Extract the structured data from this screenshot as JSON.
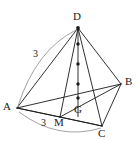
{
  "figure": {
    "background_color": "#ffffff",
    "edge_color": "#1a1a1a",
    "arc_color": "#8a8a8a",
    "point_color": "#1a1a1a",
    "width": 140,
    "height": 142,
    "vertices": [
      {
        "name": "D",
        "label": "D",
        "x": 78,
        "y": 28,
        "label_x": 73,
        "label_y": 13
      },
      {
        "name": "A",
        "label": "A",
        "x": 17,
        "y": 108,
        "label_x": 4,
        "label_y": 102
      },
      {
        "name": "B",
        "label": "B",
        "x": 121,
        "y": 84,
        "label_x": 126,
        "label_y": 77
      },
      {
        "name": "C",
        "label": "C",
        "x": 102,
        "y": 126,
        "label_x": 99,
        "label_y": 128
      },
      {
        "name": "M",
        "label": "M",
        "x": 60,
        "y": 117,
        "label_x": 55,
        "label_y": 118
      },
      {
        "name": "G",
        "label": "G",
        "x": 78,
        "y": 98,
        "label_x": 75,
        "label_y": 105
      }
    ],
    "edges": [
      {
        "name": "edge-DA",
        "from": "D",
        "to": "A"
      },
      {
        "name": "edge-DB",
        "from": "D",
        "to": "B"
      },
      {
        "name": "edge-DC",
        "from": "D",
        "to": "C"
      },
      {
        "name": "edge-DM",
        "from": "D",
        "to": "M"
      },
      {
        "name": "edge-AB",
        "from": "A",
        "to": "B"
      },
      {
        "name": "edge-AC",
        "from": "A",
        "to": "C"
      },
      {
        "name": "edge-AM",
        "from": "A",
        "to": "M"
      },
      {
        "name": "edge-MB",
        "from": "M",
        "to": "B"
      },
      {
        "name": "edge-MC",
        "from": "M",
        "to": "C"
      },
      {
        "name": "edge-BC",
        "from": "B",
        "to": "C"
      }
    ],
    "marked_points": [
      {
        "name": "tick-point-1",
        "x": 78,
        "y": 44
      },
      {
        "name": "tick-point-2",
        "x": 78,
        "y": 64
      },
      {
        "name": "tick-point-3",
        "x": 78,
        "y": 84
      },
      {
        "name": "centroid-point-G",
        "x": 78,
        "y": 98
      },
      {
        "name": "apex-point-D",
        "x": 78,
        "y": 28
      }
    ],
    "arcs": [
      {
        "name": "arc-measure-AD",
        "path": "M 18 106 Q 36 50 76 30",
        "label": "3",
        "label_x": 34,
        "label_y": 50
      },
      {
        "name": "arc-measure-AC",
        "path": "M 19 112 Q 58 141 101 128",
        "label": "3",
        "label_x": 42,
        "label_y": 119
      }
    ]
  }
}
